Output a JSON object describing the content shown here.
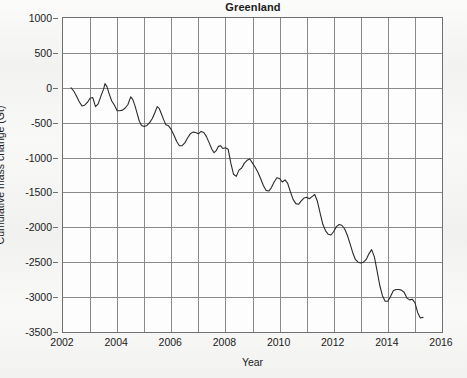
{
  "chart_data": {
    "type": "line",
    "title": "Greenland",
    "xlabel": "Year",
    "ylabel": "Cumulative mass change (Gt)",
    "xlim": [
      2002,
      2016
    ],
    "ylim": [
      -3500,
      1000
    ],
    "xticks": [
      2002,
      2004,
      2006,
      2008,
      2010,
      2012,
      2014,
      2016
    ],
    "xticklabels": [
      "2002",
      "2004",
      "2006",
      "2008",
      "2010",
      "2012",
      "2014",
      "2016"
    ],
    "xminorticks": [
      2003,
      2005,
      2007,
      2009,
      2011,
      2013,
      2015
    ],
    "yticks": [
      1000,
      500,
      0,
      -500,
      -1000,
      -1500,
      -2000,
      -2500,
      -3000,
      -3500
    ],
    "yticklabels": [
      "1000",
      "500",
      "0",
      "-500",
      "-1000",
      "-1500",
      "-2000",
      "-2500",
      "-3000",
      "-3500"
    ],
    "grid": true,
    "legend": null,
    "series": [
      {
        "name": "Greenland cumulative mass change",
        "color": "#2b2b2b",
        "linewidth": 1.1,
        "x": [
          2002.3,
          2002.4,
          2002.5,
          2002.6,
          2002.7,
          2002.8,
          2002.9,
          2003.0,
          2003.1,
          2003.2,
          2003.3,
          2003.4,
          2003.5,
          2003.55,
          2003.62,
          2003.7,
          2003.8,
          2003.9,
          2004.0,
          2004.1,
          2004.2,
          2004.3,
          2004.4,
          2004.5,
          2004.58,
          2004.66,
          2004.74,
          2004.82,
          2004.9,
          2005.0,
          2005.1,
          2005.2,
          2005.3,
          2005.4,
          2005.48,
          2005.56,
          2005.64,
          2005.72,
          2005.8,
          2005.9,
          2006.0,
          2006.1,
          2006.2,
          2006.3,
          2006.4,
          2006.5,
          2006.6,
          2006.7,
          2006.8,
          2006.9,
          2007.0,
          2007.1,
          2007.2,
          2007.3,
          2007.4,
          2007.5,
          2007.58,
          2007.66,
          2007.74,
          2007.82,
          2007.9,
          2008.0,
          2008.1,
          2008.2,
          2008.3,
          2008.4,
          2008.5,
          2008.6,
          2008.7,
          2008.8,
          2008.9,
          2009.0,
          2009.1,
          2009.2,
          2009.3,
          2009.4,
          2009.5,
          2009.6,
          2009.7,
          2009.8,
          2009.9,
          2010.0,
          2010.1,
          2010.2,
          2010.3,
          2010.4,
          2010.5,
          2010.6,
          2010.7,
          2010.8,
          2010.9,
          2011.0,
          2011.1,
          2011.2,
          2011.3,
          2011.4,
          2011.5,
          2011.6,
          2011.7,
          2011.8,
          2011.9,
          2012.0,
          2012.1,
          2012.2,
          2012.3,
          2012.4,
          2012.5,
          2012.6,
          2012.7,
          2012.8,
          2012.9,
          2013.0,
          2013.1,
          2013.2,
          2013.3,
          2013.4,
          2013.5,
          2013.6,
          2013.7,
          2013.8,
          2013.9,
          2014.0,
          2014.1,
          2014.2,
          2014.3,
          2014.4,
          2014.5,
          2014.6,
          2014.7,
          2014.8,
          2014.9,
          2015.0,
          2015.1,
          2015.2,
          2015.3
        ],
        "y": [
          0,
          -50,
          -120,
          -200,
          -260,
          -250,
          -210,
          -150,
          -140,
          -270,
          -230,
          -120,
          -20,
          60,
          20,
          -80,
          -190,
          -250,
          -330,
          -330,
          -320,
          -290,
          -240,
          -130,
          -170,
          -260,
          -370,
          -480,
          -540,
          -555,
          -540,
          -500,
          -440,
          -350,
          -270,
          -300,
          -380,
          -460,
          -530,
          -545,
          -600,
          -680,
          -770,
          -830,
          -830,
          -790,
          -720,
          -660,
          -635,
          -640,
          -660,
          -625,
          -640,
          -700,
          -790,
          -880,
          -930,
          -900,
          -840,
          -830,
          -870,
          -860,
          -880,
          -1080,
          -1240,
          -1270,
          -1180,
          -1150,
          -1080,
          -1040,
          -1020,
          -1080,
          -1140,
          -1210,
          -1300,
          -1400,
          -1470,
          -1480,
          -1430,
          -1350,
          -1290,
          -1300,
          -1350,
          -1320,
          -1370,
          -1490,
          -1600,
          -1660,
          -1670,
          -1620,
          -1580,
          -1570,
          -1590,
          -1560,
          -1530,
          -1630,
          -1800,
          -1960,
          -2050,
          -2100,
          -2110,
          -2060,
          -1990,
          -1960,
          -1970,
          -2020,
          -2110,
          -2230,
          -2360,
          -2460,
          -2500,
          -2510,
          -2500,
          -2460,
          -2380,
          -2320,
          -2420,
          -2620,
          -2830,
          -2980,
          -3060,
          -3060,
          -2990,
          -2910,
          -2890,
          -2890,
          -2900,
          -2930,
          -3010,
          -3040,
          -3030,
          -3080,
          -3220,
          -3300,
          -3290
        ]
      }
    ]
  },
  "style": {
    "plot_bg": "#fdfdfd",
    "page_bg": "#f1f1ef",
    "grid_color": "#8a8a8a",
    "frame_color": "#6f6f6f",
    "line_color": "#2b2b2b",
    "text_color": "#1b1b1b"
  }
}
